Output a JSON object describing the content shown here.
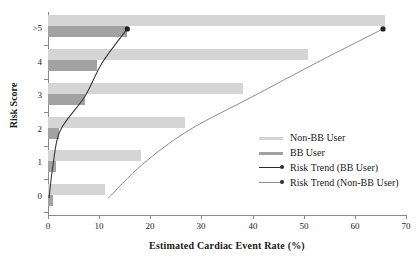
{
  "chart_data": {
    "type": "bar",
    "title": "",
    "xlabel": "Estimated Cardiac Event Rate (%)",
    "ylabel": "Risk Score",
    "orientation": "horizontal",
    "categories": [
      "0",
      "1",
      "2",
      "3",
      "4",
      ">5"
    ],
    "xlim": [
      0,
      70
    ],
    "xticks": [
      0,
      10,
      20,
      30,
      40,
      50,
      60,
      70
    ],
    "xtick_labels": [
      "0",
      "10",
      "20",
      "30",
      "40",
      "50",
      "60",
      "70"
    ],
    "ytick_labels": [
      ">5",
      "4",
      "3",
      "2",
      "1",
      "0"
    ],
    "grid": false,
    "legend_position": "right-center",
    "series": [
      {
        "name": "Non-BB User",
        "type": "bar",
        "color": "#d5d5d5",
        "categories": [
          "0",
          "1",
          "2",
          "3",
          "4",
          ">5"
        ],
        "values": [
          11.2,
          18.2,
          26.8,
          38.2,
          50.8,
          65.8
        ]
      },
      {
        "name": "BB User",
        "type": "bar",
        "color": "#a2a2a2",
        "categories": [
          "0",
          "1",
          "2",
          "3",
          "4",
          ">5"
        ],
        "values": [
          0.9,
          1.6,
          2.2,
          7.2,
          9.6,
          15.5
        ]
      },
      {
        "name": "Risk Trend (BB User)",
        "type": "line",
        "color": "#2b2b2b",
        "marker": "circle",
        "points": [
          {
            "x": 0.2,
            "y": "0"
          },
          {
            "x": 1.0,
            "y": "1"
          },
          {
            "x": 2.4,
            "y": "2"
          },
          {
            "x": 7.2,
            "y": "3"
          },
          {
            "x": 10.6,
            "y": "4"
          },
          {
            "x": 15.5,
            "y": ">5"
          }
        ],
        "endpoint": {
          "x": 15.5,
          "y": ">5"
        }
      },
      {
        "name": "Risk Trend (Non-BB User)",
        "type": "line",
        "color": "#7d7d7d",
        "marker": "circle",
        "points": [
          {
            "x": 11.8,
            "y": "0"
          },
          {
            "x": 18.5,
            "y": "1"
          },
          {
            "x": 27.5,
            "y": "2"
          },
          {
            "x": 40.0,
            "y": "3"
          },
          {
            "x": 52.5,
            "y": "4"
          },
          {
            "x": 65.5,
            "y": ">5"
          }
        ],
        "endpoint": {
          "x": 65.5,
          "y": ">5"
        }
      }
    ]
  },
  "axes": {
    "x_title": "Estimated Cardiac Event Rate (%)",
    "y_title": "Risk Score",
    "x_ticks": [
      "0",
      "10",
      "20",
      "30",
      "40",
      "50",
      "60",
      "70"
    ],
    "y_ticks": [
      ">5",
      "4",
      "3",
      "2",
      "1",
      "0"
    ]
  },
  "legend": {
    "items": [
      {
        "label": "Non-BB User",
        "kind": "swatch",
        "color": "#d5d5d5"
      },
      {
        "label": "BB User",
        "kind": "swatch",
        "color": "#a2a2a2"
      },
      {
        "label": "Risk Trend (BB User)",
        "kind": "line-marker",
        "color": "#2b2b2b"
      },
      {
        "label": "Risk Trend (Non-BB User)",
        "kind": "line-marker",
        "color": "#7d7d7d"
      }
    ]
  }
}
